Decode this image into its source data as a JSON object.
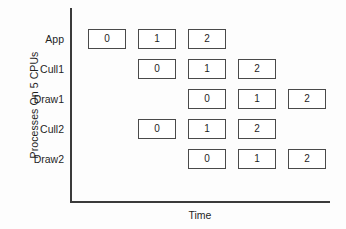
{
  "figure": {
    "x_axis_title": "Time",
    "y_axis_title": "Processes On 5 CPUs"
  },
  "chart_data": {
    "type": "table",
    "title": "",
    "xlabel": "Time",
    "ylabel": "Processes On 5 CPUs",
    "grid": false,
    "legend": null,
    "x_tick_labels": [],
    "y_tick_labels": [
      "App",
      "Cull1",
      "Draw1",
      "Cull2",
      "Draw2"
    ],
    "column_count": 5,
    "rows": [
      {
        "label": "App",
        "cells": [
          {
            "column": 0,
            "value": "0"
          },
          {
            "column": 1,
            "value": "1"
          },
          {
            "column": 2,
            "value": "2"
          }
        ]
      },
      {
        "label": "Cull1",
        "cells": [
          {
            "column": 1,
            "value": "0"
          },
          {
            "column": 2,
            "value": "1"
          },
          {
            "column": 3,
            "value": "2"
          }
        ]
      },
      {
        "label": "Draw1",
        "cells": [
          {
            "column": 2,
            "value": "0"
          },
          {
            "column": 3,
            "value": "1"
          },
          {
            "column": 4,
            "value": "2"
          }
        ]
      },
      {
        "label": "Cull2",
        "cells": [
          {
            "column": 1,
            "value": "0"
          },
          {
            "column": 2,
            "value": "1"
          },
          {
            "column": 3,
            "value": "2"
          }
        ]
      },
      {
        "label": "Draw2",
        "cells": [
          {
            "column": 2,
            "value": "0"
          },
          {
            "column": 3,
            "value": "1"
          },
          {
            "column": 4,
            "value": "2"
          }
        ]
      }
    ]
  },
  "layout": {
    "plot_left": 88,
    "column_pitch": 50,
    "row_top": 29,
    "row_pitch": 30,
    "label_offset_y": 4
  },
  "colors": {
    "axis": "#3b3b3b",
    "box_border": "#4a4a4a",
    "box_fill": "#ffffff",
    "text": "#1f1f1f",
    "background": "#fdfdfd"
  }
}
